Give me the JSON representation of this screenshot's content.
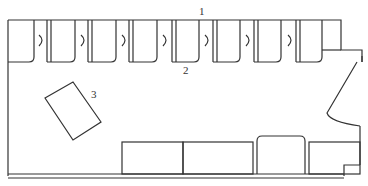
{
  "diagram": {
    "type": "floor-plan",
    "stroke_color": "#333333",
    "background": "#ffffff",
    "labels": [
      {
        "id": "1",
        "text": "1",
        "target": "top wall / stall row"
      },
      {
        "id": "2",
        "text": "2",
        "target": "stall (fifth stall)"
      },
      {
        "id": "3",
        "text": "3",
        "target": "tilted rectangular object"
      }
    ],
    "stalls": {
      "count": 8
    },
    "bottom_fixtures": [
      {
        "name": "counter-left"
      },
      {
        "name": "counter-middle"
      },
      {
        "name": "rounded-unit"
      },
      {
        "name": "counter-right"
      }
    ]
  }
}
